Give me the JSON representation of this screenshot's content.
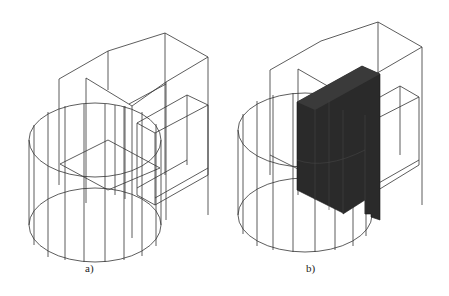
{
  "figure": {
    "panels": [
      {
        "id": "a",
        "caption": "a)",
        "description": "Wireframe isometric view: cylinder overlapping with stepped rectangular blocks"
      },
      {
        "id": "b",
        "caption": "b)",
        "description": "Same wireframe with the intersecting solid region shaded dark"
      }
    ],
    "colors": {
      "line": "#333333",
      "solid": "#2a2a2a",
      "background": "#ffffff"
    }
  }
}
